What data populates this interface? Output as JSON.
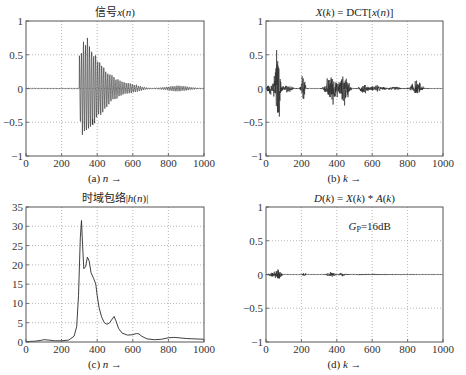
{
  "chart_data": [
    {
      "id": "a",
      "type": "line",
      "title": "信号x(n)",
      "title_parts": [
        {
          "text": "信号",
          "italic": false
        },
        {
          "text": "x",
          "italic": true
        },
        {
          "text": "(",
          "italic": false
        },
        {
          "text": "n",
          "italic": true
        },
        {
          "text": ")",
          "italic": false
        }
      ],
      "caption": "(a)",
      "xlabel": "n →",
      "xlim": [
        0,
        1000
      ],
      "ylim": [
        -1,
        1
      ],
      "xticks": [
        0,
        200,
        400,
        600,
        800,
        1000
      ],
      "yticks": [
        -1,
        -0.5,
        0,
        0.5,
        1
      ],
      "ytick_labels": [
        "−1",
        "−0.5",
        "0",
        "0.5",
        "1"
      ],
      "grid": true,
      "signal": {
        "description": "decaying oscillation burst starting near n=300",
        "onset": 300,
        "peak_max": 0.78,
        "peak_min": -0.65,
        "bursts": [
          {
            "center": 330,
            "width": 90,
            "amp": 0.72
          },
          {
            "center": 460,
            "width": 90,
            "amp": 0.18
          },
          {
            "center": 600,
            "width": 60,
            "amp": 0.05
          },
          {
            "center": 850,
            "width": 80,
            "amp": 0.04
          }
        ]
      }
    },
    {
      "id": "b",
      "type": "line",
      "title": "X(k) = DCT[x(n)]",
      "title_parts": [
        {
          "text": "X",
          "italic": true
        },
        {
          "text": "(",
          "italic": false
        },
        {
          "text": "k",
          "italic": true
        },
        {
          "text": ") = DCT[",
          "italic": false
        },
        {
          "text": "x",
          "italic": true
        },
        {
          "text": "(",
          "italic": false
        },
        {
          "text": "n",
          "italic": true
        },
        {
          "text": ")]",
          "italic": false
        }
      ],
      "caption": "(b)",
      "xlabel": "k →",
      "xlim": [
        0,
        1000
      ],
      "ylim": [
        -1,
        1
      ],
      "xticks": [
        0,
        200,
        400,
        600,
        800,
        1000
      ],
      "yticks": [
        -1,
        -0.5,
        0,
        0.5,
        1
      ],
      "ytick_labels": [
        "−1",
        "−0.5",
        "0",
        "0.5",
        "1"
      ],
      "grid": true,
      "signal": {
        "description": "DCT coefficients with clusters of energy",
        "bursts": [
          {
            "center": 65,
            "width": 30,
            "amp": 0.7
          },
          {
            "center": 30,
            "width": 60,
            "amp": 0.1
          },
          {
            "center": 120,
            "width": 60,
            "amp": 0.06
          },
          {
            "center": 210,
            "width": 25,
            "amp": 0.28
          },
          {
            "center": 370,
            "width": 60,
            "amp": 0.3
          },
          {
            "center": 440,
            "width": 50,
            "amp": 0.32
          },
          {
            "center": 550,
            "width": 40,
            "amp": 0.1
          },
          {
            "center": 620,
            "width": 80,
            "amp": 0.05
          },
          {
            "center": 850,
            "width": 60,
            "amp": 0.12
          },
          {
            "center": 720,
            "width": 80,
            "amp": 0.03
          }
        ]
      }
    },
    {
      "id": "c",
      "type": "line",
      "title": "时域包络|h(n)|",
      "title_parts": [
        {
          "text": "时域包络|",
          "italic": false
        },
        {
          "text": "h",
          "italic": true
        },
        {
          "text": "(",
          "italic": false
        },
        {
          "text": "n",
          "italic": true
        },
        {
          "text": ")|",
          "italic": false
        }
      ],
      "caption": "(c)",
      "xlabel": "n →",
      "xlim": [
        0,
        1000
      ],
      "ylim": [
        0,
        35
      ],
      "xticks": [
        0,
        200,
        400,
        600,
        800,
        1000
      ],
      "yticks": [
        0,
        5,
        10,
        15,
        20,
        25,
        30,
        35
      ],
      "ytick_labels": [
        "0",
        "5",
        "10",
        "15",
        "20",
        "25",
        "30",
        "35"
      ],
      "grid": true,
      "x": [
        0,
        50,
        80,
        100,
        130,
        160,
        200,
        240,
        270,
        285,
        295,
        305,
        312,
        318,
        325,
        335,
        345,
        355,
        365,
        380,
        392,
        400,
        410,
        425,
        440,
        455,
        470,
        485,
        495,
        505,
        520,
        540,
        570,
        600,
        620,
        635,
        650,
        680,
        720,
        760,
        800,
        830,
        860,
        900,
        950,
        1000
      ],
      "y": [
        0.1,
        0.2,
        0.4,
        0.6,
        0.5,
        0.3,
        0.3,
        0.5,
        1.5,
        4,
        12,
        27,
        31.5,
        25,
        19,
        19.5,
        22,
        21,
        18,
        16.5,
        15,
        12,
        9,
        6.5,
        5,
        4.6,
        5,
        6,
        6.6,
        5.5,
        3.5,
        2.3,
        1.8,
        1.9,
        2.2,
        2.1,
        1.5,
        0.8,
        0.6,
        0.7,
        1.1,
        1.2,
        1.1,
        0.9,
        0.8,
        0.7
      ]
    },
    {
      "id": "d",
      "type": "line",
      "title": "D(k) = X(k) * A(k)",
      "title_parts": [
        {
          "text": "D",
          "italic": true
        },
        {
          "text": "(",
          "italic": false
        },
        {
          "text": "k",
          "italic": true
        },
        {
          "text": ") = ",
          "italic": false
        },
        {
          "text": "X",
          "italic": true
        },
        {
          "text": "(",
          "italic": false
        },
        {
          "text": "k",
          "italic": true
        },
        {
          "text": ") * ",
          "italic": false
        },
        {
          "text": "A",
          "italic": true
        },
        {
          "text": "(",
          "italic": false
        },
        {
          "text": "k",
          "italic": true
        },
        {
          "text": ")",
          "italic": false
        }
      ],
      "caption": "(d)",
      "xlabel": "k →",
      "xlim": [
        0,
        1000
      ],
      "ylim": [
        -1,
        1
      ],
      "xticks": [
        0,
        200,
        400,
        600,
        800,
        1000
      ],
      "yticks": [
        -1,
        -0.5,
        0,
        0.5,
        1
      ],
      "ytick_labels": [
        "−1",
        "−0.5",
        "0",
        "0.5",
        "1"
      ],
      "grid": true,
      "annotation": {
        "text": "Gp=16dB",
        "x": 500,
        "y": 0.72
      },
      "signal": {
        "description": "attenuated DCT coefficients",
        "bursts": [
          {
            "center": 70,
            "width": 30,
            "amp": 0.12
          },
          {
            "center": 40,
            "width": 60,
            "amp": 0.03
          },
          {
            "center": 215,
            "width": 20,
            "amp": 0.03
          },
          {
            "center": 370,
            "width": 50,
            "amp": 0.04
          },
          {
            "center": 430,
            "width": 30,
            "amp": 0.025
          },
          {
            "center": 600,
            "width": 300,
            "amp": 0.006
          }
        ]
      }
    }
  ],
  "layout": {
    "panels": {
      "a": {
        "left": 26,
        "top": 21,
        "right": 204,
        "bottom": 156
      },
      "b": {
        "left": 266,
        "top": 21,
        "right": 443,
        "bottom": 156
      },
      "c": {
        "left": 26,
        "top": 207,
        "right": 204,
        "bottom": 342
      },
      "d": {
        "left": 266,
        "top": 207,
        "right": 443,
        "bottom": 342
      }
    },
    "colors": {
      "line": "#2a2a2a",
      "frame": "#555555",
      "grid": "#9a9a9a",
      "text": "#222222"
    }
  }
}
